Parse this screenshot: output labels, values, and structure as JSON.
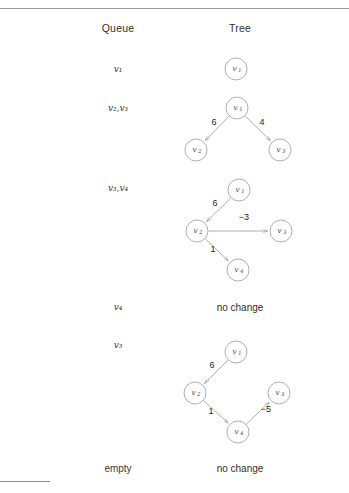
{
  "figure": {
    "header": {
      "queue_label": "Queue",
      "tree_label": "Tree"
    },
    "rows": [
      {
        "queue": "v₁",
        "queue_items": [
          "v1"
        ],
        "tree_kind": "graph"
      },
      {
        "queue": "v₂,v₃",
        "queue_items": [
          "v2",
          "v3"
        ],
        "tree_kind": "graph"
      },
      {
        "queue": "v₃,v₄",
        "queue_items": [
          "v3",
          "v4"
        ],
        "tree_kind": "graph"
      },
      {
        "queue": "v₄",
        "queue_items": [
          "v4"
        ],
        "tree_kind": "text",
        "tree_text": "no change"
      },
      {
        "queue": "v₃",
        "queue_items": [
          "v3"
        ],
        "tree_kind": "graph"
      },
      {
        "queue": "empty",
        "queue_items": [],
        "tree_kind": "text",
        "tree_text": "no change"
      }
    ],
    "graphs": [
      {
        "id": "graph-1",
        "nodes": [
          {
            "id": "v1",
            "base": "v",
            "sub": "1",
            "x": 236,
            "y": 69
          }
        ],
        "edges": []
      },
      {
        "id": "graph-2",
        "nodes": [
          {
            "id": "v1",
            "base": "v",
            "sub": "1",
            "x": 237,
            "y": 108
          },
          {
            "id": "v2",
            "base": "v",
            "sub": "2",
            "x": 196,
            "y": 150
          },
          {
            "id": "v3",
            "base": "v",
            "sub": "3",
            "x": 280,
            "y": 150
          }
        ],
        "edges": [
          {
            "from": "v1",
            "to": "v2",
            "weight": "6",
            "lx": 214,
            "ly": 123
          },
          {
            "from": "v1",
            "to": "v3",
            "weight": "4",
            "lx": 262,
            "ly": 123
          }
        ]
      },
      {
        "id": "graph-3",
        "nodes": [
          {
            "id": "v1",
            "base": "v",
            "sub": "1",
            "x": 239,
            "y": 190
          },
          {
            "id": "v2",
            "base": "v",
            "sub": "2",
            "x": 197,
            "y": 231
          },
          {
            "id": "v3",
            "base": "v",
            "sub": "3",
            "x": 281,
            "y": 231
          },
          {
            "id": "v4",
            "base": "v",
            "sub": "4",
            "x": 238,
            "y": 270
          }
        ],
        "edges": [
          {
            "from": "v1",
            "to": "v2",
            "weight": "6",
            "lx": 215,
            "ly": 204
          },
          {
            "from": "v2",
            "to": "v3",
            "weight": "−3",
            "lx": 244,
            "ly": 218
          },
          {
            "from": "v2",
            "to": "v4",
            "weight": "1",
            "lx": 213,
            "ly": 250
          }
        ]
      },
      {
        "id": "graph-4",
        "nodes": [
          {
            "id": "v1",
            "base": "v",
            "sub": "1",
            "x": 236,
            "y": 352
          },
          {
            "id": "v2",
            "base": "v",
            "sub": "2",
            "x": 195,
            "y": 393
          },
          {
            "id": "v3",
            "base": "v",
            "sub": "3",
            "x": 279,
            "y": 393
          },
          {
            "id": "v4",
            "base": "v",
            "sub": "4",
            "x": 238,
            "y": 432
          }
        ],
        "edges": [
          {
            "from": "v1",
            "to": "v2",
            "weight": "6",
            "lx": 212,
            "ly": 366
          },
          {
            "from": "v2",
            "to": "v4",
            "weight": "1",
            "lx": 211,
            "ly": 412
          },
          {
            "from": "v4",
            "to": "v3",
            "weight": "−5",
            "lx": 266,
            "ly": 410
          }
        ]
      }
    ],
    "positions": {
      "queue_column_x": 118,
      "tree_column_x": 240,
      "header_y": 22,
      "row_queue_y": [
        69,
        108,
        188,
        307,
        345,
        468
      ],
      "tree_text_y": [
        307,
        468
      ]
    },
    "colors": {
      "text": "#2b2b2b",
      "stroke": "#8a8a8a",
      "rule": "#9a9a9a",
      "background": "#ffffff"
    },
    "node_radius": 11
  }
}
